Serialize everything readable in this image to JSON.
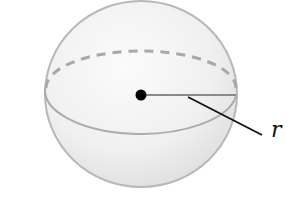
{
  "diagram": {
    "type": "sphere",
    "label": "r",
    "label_meaning": "radius",
    "colors": {
      "sphere_fill_light": "#f7f7f7",
      "sphere_fill_dark": "#e2e2e2",
      "outline": "#b5b5b5",
      "equator": "#a9a9a9",
      "radius_line": "#8a8a8a",
      "center_dot": "#000000",
      "leader_line": "#111111"
    }
  }
}
